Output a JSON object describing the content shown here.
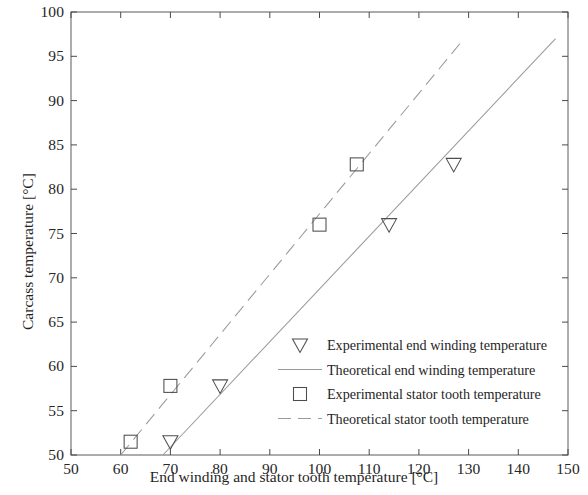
{
  "chart_data": {
    "type": "scatter",
    "title": "",
    "xlabel": "End winding and stator tooth temperature [°C]",
    "ylabel": "Carcass temperature [°C]",
    "xlim": [
      50,
      150
    ],
    "ylim": [
      50,
      100
    ],
    "xticks": [
      50,
      60,
      70,
      80,
      90,
      100,
      110,
      120,
      130,
      140,
      150
    ],
    "yticks": [
      50,
      55,
      60,
      65,
      70,
      75,
      80,
      85,
      90,
      95,
      100
    ],
    "xtick_labels": [
      "50",
      "60",
      "70",
      "80",
      "90",
      "100",
      "110",
      "120",
      "130",
      "140",
      "150"
    ],
    "ytick_labels": [
      "50",
      "55",
      "60",
      "65",
      "70",
      "75",
      "80",
      "85",
      "90",
      "95",
      "100"
    ],
    "grid": false,
    "legend_position": "lower right",
    "series": [
      {
        "name": "Experimental end winding temperature",
        "kind": "scatter",
        "marker": "triangle-down",
        "color": "#4d4d4d",
        "x": [
          70,
          80,
          114,
          127
        ],
        "y": [
          51.5,
          57.8,
          76.0,
          82.8
        ]
      },
      {
        "name": "Theoretical end winding temperature",
        "kind": "line",
        "linestyle": "solid",
        "color": "#9a9a9a",
        "x": [
          68.5,
          147.5
        ],
        "y": [
          50.0,
          97.0
        ]
      },
      {
        "name": "Experimental stator tooth temperature",
        "kind": "scatter",
        "marker": "square",
        "color": "#4d4d4d",
        "x": [
          62,
          70,
          100,
          107.5
        ],
        "y": [
          51.5,
          57.8,
          76.0,
          82.8
        ]
      },
      {
        "name": "Theoretical stator tooth temperature",
        "kind": "line",
        "linestyle": "dashed",
        "color": "#9a9a9a",
        "x": [
          60.0,
          128.5
        ],
        "y": [
          50.0,
          96.6
        ]
      }
    ]
  },
  "legend": {
    "entries": [
      {
        "label": "Experimental end winding temperature",
        "symbol": "triangle-down-icon"
      },
      {
        "label": "Theoretical end winding temperature",
        "symbol": "solid-line-icon"
      },
      {
        "label": "Experimental stator tooth temperature",
        "symbol": "square-icon"
      },
      {
        "label": "Theoretical stator tooth temperature",
        "symbol": "dashed-line-icon"
      }
    ]
  },
  "colors": {
    "axis": "#4a4a4a",
    "marker": "#4d4d4d",
    "line": "#9a9a9a",
    "text": "#1f1f1f",
    "background": "#ffffff"
  }
}
